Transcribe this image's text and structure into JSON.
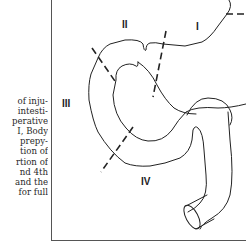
{
  "caption_fragment": {
    "lines": [
      "of inju-",
      "intesti-",
      "perative",
      "I, Body",
      "prepy-",
      "tion of",
      "rtion of",
      "nd 4th",
      "and the",
      "for full"
    ]
  },
  "figure": {
    "labels": {
      "region_1": "I",
      "region_2": "II",
      "region_3": "III",
      "region_4": "IV"
    },
    "stroke_color": "#222222",
    "border_color": "#555555"
  }
}
